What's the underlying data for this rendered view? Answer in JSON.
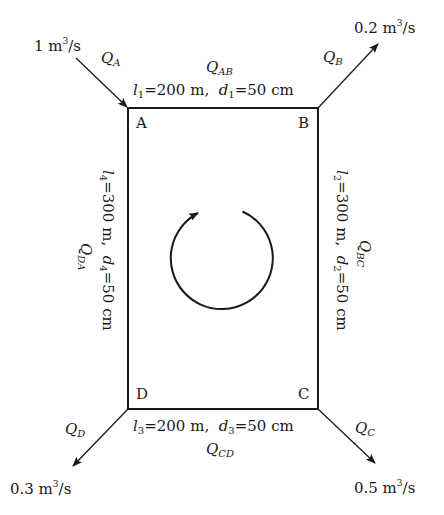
{
  "diagram": {
    "type": "pipe-network-loop",
    "nodes": [
      {
        "id": "A",
        "label": "A"
      },
      {
        "id": "B",
        "label": "B"
      },
      {
        "id": "C",
        "label": "C"
      },
      {
        "id": "D",
        "label": "D"
      }
    ],
    "pipes": [
      {
        "id": "AB",
        "flow_label": "Q",
        "flow_sub": "AB",
        "l_var": "l",
        "l_sub": "1",
        "length": "200 m",
        "d_var": "d",
        "d_sub": "1",
        "diameter": "50 cm"
      },
      {
        "id": "BC",
        "flow_label": "Q",
        "flow_sub": "BC",
        "l_var": "l",
        "l_sub": "2",
        "length": "300 m",
        "d_var": "d",
        "d_sub": "2",
        "diameter": "50 cm"
      },
      {
        "id": "CD",
        "flow_label": "Q",
        "flow_sub": "CD",
        "l_var": "l",
        "l_sub": "3",
        "length": "200 m",
        "d_var": "d",
        "d_sub": "3",
        "diameter": "50 cm"
      },
      {
        "id": "DA",
        "flow_label": "Q",
        "flow_sub": "DA",
        "l_var": "l",
        "l_sub": "4",
        "length": "300 m",
        "d_var": "d",
        "d_sub": "4",
        "diameter": "50 cm"
      }
    ],
    "external_flows": [
      {
        "node": "A",
        "label": "Q",
        "sub": "A",
        "value": "1 m",
        "unit_tail": "/s",
        "exp": "3",
        "direction": "in"
      },
      {
        "node": "B",
        "label": "Q",
        "sub": "B",
        "value": "0.2 m",
        "unit_tail": "/s",
        "exp": "3",
        "direction": "out"
      },
      {
        "node": "C",
        "label": "Q",
        "sub": "C",
        "value": "0.5 m",
        "unit_tail": "/s",
        "exp": "3",
        "direction": "out"
      },
      {
        "node": "D",
        "label": "Q",
        "sub": "D",
        "value": "0.3 m",
        "unit_tail": "/s",
        "exp": "3",
        "direction": "out"
      }
    ],
    "loop_direction": "clockwise",
    "separator": "=",
    "comma": ","
  }
}
